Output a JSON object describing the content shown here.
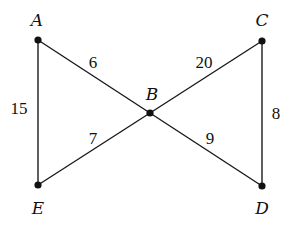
{
  "diagram": {
    "type": "weighted-graph",
    "vertices": [
      {
        "id": "A",
        "label": "A",
        "x": 38,
        "y": 40,
        "lx": 37,
        "ly": 26
      },
      {
        "id": "B",
        "label": "B",
        "x": 150,
        "y": 113,
        "lx": 152,
        "ly": 100
      },
      {
        "id": "C",
        "label": "C",
        "x": 262,
        "y": 41,
        "lx": 262,
        "ly": 26
      },
      {
        "id": "D",
        "label": "D",
        "x": 262,
        "y": 186,
        "lx": 262,
        "ly": 214
      },
      {
        "id": "E",
        "label": "E",
        "x": 38,
        "y": 185,
        "lx": 38,
        "ly": 214
      }
    ],
    "edges": [
      {
        "from": "A",
        "to": "B",
        "weight": "6",
        "lx": 93,
        "ly": 68
      },
      {
        "from": "B",
        "to": "C",
        "weight": "20",
        "lx": 204,
        "ly": 68
      },
      {
        "from": "A",
        "to": "E",
        "weight": "15",
        "lx": 19,
        "ly": 114
      },
      {
        "from": "C",
        "to": "D",
        "weight": "8",
        "lx": 276,
        "ly": 119
      },
      {
        "from": "E",
        "to": "B",
        "weight": "7",
        "lx": 93,
        "ly": 144
      },
      {
        "from": "B",
        "to": "D",
        "weight": "9",
        "lx": 210,
        "ly": 144
      }
    ]
  }
}
